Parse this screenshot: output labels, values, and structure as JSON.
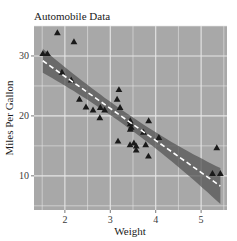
{
  "chart_data": {
    "type": "scatter",
    "title": "Automobile Data",
    "xlabel": "Weight",
    "ylabel": "Miles Per Gallon",
    "xlim": [
      1.32,
      5.57
    ],
    "ylim": [
      4.3,
      35.0
    ],
    "xticks": [
      2,
      3,
      4,
      5
    ],
    "yticks": [
      10,
      20,
      30
    ],
    "grid": true,
    "legend": null,
    "colors": {
      "panel_background": "#a8a8a8",
      "grid": "#e6e6e6",
      "points": "#1a1a1a",
      "confidence_band": "#555555",
      "regression_line": "#ffffff"
    },
    "marker": "triangle",
    "series": [
      {
        "name": "cars",
        "x": [
          2.62,
          2.875,
          2.32,
          3.215,
          3.44,
          3.46,
          3.57,
          3.19,
          3.15,
          3.44,
          3.44,
          4.07,
          3.73,
          3.78,
          5.25,
          5.424,
          5.345,
          2.2,
          1.615,
          1.835,
          2.465,
          3.52,
          3.435,
          3.84,
          3.845,
          1.935,
          2.14,
          1.513,
          3.17,
          2.77,
          3.57,
          2.78
        ],
        "y": [
          21.0,
          21.0,
          22.8,
          21.4,
          18.7,
          18.1,
          14.3,
          24.4,
          22.8,
          19.2,
          17.8,
          16.4,
          17.3,
          15.2,
          10.4,
          10.4,
          14.7,
          32.4,
          30.4,
          33.9,
          21.5,
          15.5,
          15.2,
          13.3,
          19.2,
          27.3,
          26.0,
          30.4,
          15.8,
          19.7,
          15.0,
          21.4
        ]
      }
    ],
    "fit": {
      "type": "linear",
      "intercept": 37.285,
      "slope": -5.344,
      "x_range": [
        1.513,
        5.424
      ],
      "line_style": "dashed",
      "confidence_band": true,
      "band_halfwidth_at_ends": [
        2.0,
        3.0
      ],
      "band_halfwidth_at_center": 1.1
    }
  }
}
